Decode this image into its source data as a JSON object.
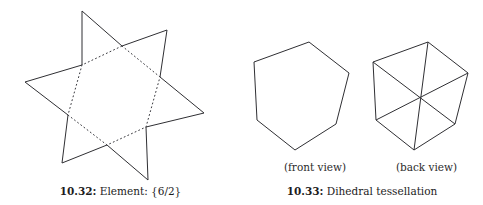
{
  "page": {
    "background_color": "#ffffff",
    "ink_color": "#2f2f33",
    "width": 483,
    "height": 205
  },
  "figures": [
    {
      "id": "figure-10-32",
      "number": "10.32:",
      "title": "Element: {6/2}",
      "diagram": {
        "name": "hexagram-star-polygon",
        "type": "star-polygon",
        "schlafli_symbol": "{6/2}",
        "outer_points": 6,
        "outer_vertices": [
          [
            82,
            11
          ],
          [
            167,
            30
          ],
          [
            204,
            113
          ],
          [
            148,
            180
          ],
          [
            62,
            163
          ],
          [
            25,
            82
          ]
        ],
        "inner_vertices": [
          [
            122,
            46
          ],
          [
            160,
            77
          ],
          [
            146,
            127
          ],
          [
            107,
            145
          ],
          [
            68,
            115
          ],
          [
            82,
            65
          ]
        ],
        "outer_stroke": "solid",
        "inner_stroke": "dotted"
      }
    },
    {
      "id": "figure-10-33",
      "number": "10.33:",
      "title": "Dihedral tessellation",
      "views": [
        {
          "label": "(front view)",
          "diagram": {
            "name": "hexagon-front-view",
            "type": "hexagon",
            "sides": 6,
            "diagonals": 0,
            "vertices": [
              [
                59,
                42
              ],
              [
                99,
                73
              ],
              [
                86,
                124
              ],
              [
                45,
                150
              ],
              [
                7,
                120
              ],
              [
                4,
                62
              ]
            ]
          }
        },
        {
          "label": "(back view)",
          "diagram": {
            "name": "hexagon-back-view",
            "type": "hexagon-tessellated",
            "sides": 6,
            "diagonals": 3,
            "triangles": 6,
            "vertices": [
              [
                59,
                42
              ],
              [
                99,
                73
              ],
              [
                86,
                124
              ],
              [
                45,
                150
              ],
              [
                7,
                120
              ],
              [
                4,
                62
              ]
            ],
            "center": [
              51,
              96
            ]
          }
        }
      ]
    }
  ]
}
